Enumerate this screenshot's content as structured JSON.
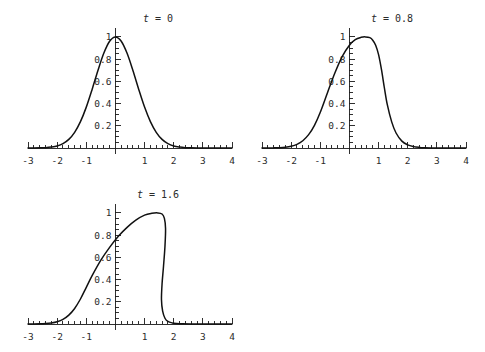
{
  "figure": {
    "background_color": "#ffffff",
    "curve_color": "#111111",
    "axis_color": "#1a1a1a",
    "label_color": "#2b2b2b"
  },
  "chart_data": [
    {
      "type": "line",
      "id": "panel-t0",
      "title": "t = 0",
      "title_var": "t",
      "title_eq": "=",
      "title_value": "0",
      "xlabel": "",
      "ylabel": "",
      "xlim": [
        -3,
        4
      ],
      "ylim": [
        0,
        1.08
      ],
      "grid": false,
      "legend": null,
      "xticks": [
        -3,
        -2,
        -1,
        1,
        2,
        3,
        4
      ],
      "xtick_labels": [
        "-3",
        "-2",
        "-1",
        "1",
        "2",
        "3",
        "4"
      ],
      "yticks": [
        0.2,
        0.4,
        0.6,
        0.8,
        1
      ],
      "ytick_labels": [
        "0.2",
        "0.4",
        "0.6",
        "0.8",
        "1"
      ],
      "x_minor_tick_step": 0.2,
      "y_minor_tick_step": 0.05,
      "x": [
        -3.0,
        -2.8,
        -2.6,
        -2.4,
        -2.2,
        -2.0,
        -1.8,
        -1.6,
        -1.4,
        -1.2,
        -1.0,
        -0.8,
        -0.6,
        -0.4,
        -0.2,
        0.0,
        0.2,
        0.4,
        0.6,
        0.8,
        1.0,
        1.2,
        1.4,
        1.6,
        1.8,
        2.0,
        2.2,
        2.4,
        2.6,
        2.8,
        3.0,
        3.2,
        3.4,
        3.6,
        3.8,
        4.0
      ],
      "y": [
        0.0001,
        0.0004,
        0.0012,
        0.0033,
        0.0085,
        0.0183,
        0.0392,
        0.0773,
        0.1409,
        0.2369,
        0.3679,
        0.5273,
        0.6977,
        0.8521,
        0.9608,
        1.0,
        0.9608,
        0.8521,
        0.6977,
        0.5273,
        0.3679,
        0.2369,
        0.1409,
        0.0773,
        0.0392,
        0.0183,
        0.0085,
        0.0033,
        0.0012,
        0.0004,
        0.0001,
        0.0,
        0.0,
        0.0,
        0.0,
        0.0
      ],
      "description": "Symmetric Gaussian pulse centred at x = 0 with peak height 1."
    },
    {
      "type": "line",
      "id": "panel-t08",
      "title": "t = 0.8",
      "title_var": "t",
      "title_eq": "=",
      "title_value": "0.8",
      "xlabel": "",
      "ylabel": "",
      "xlim": [
        -3,
        4
      ],
      "ylim": [
        0,
        1.08
      ],
      "grid": false,
      "legend": null,
      "xticks": [
        -3,
        -2,
        -1,
        1,
        2,
        3,
        4
      ],
      "xtick_labels": [
        "-3",
        "-2",
        "-1",
        "1",
        "2",
        "3",
        "4"
      ],
      "yticks": [
        0.2,
        0.4,
        0.6,
        0.8,
        1
      ],
      "ytick_labels": [
        "0.2",
        "0.4",
        "0.6",
        "0.8",
        "1"
      ],
      "x_minor_tick_step": 0.2,
      "y_minor_tick_step": 0.05,
      "x": [
        -3.0,
        -2.8,
        -2.6,
        -2.4,
        -2.2,
        -2.0,
        -1.8,
        -1.6,
        -1.4,
        -1.2,
        -1.0,
        -0.75,
        -0.5,
        -0.25,
        0.0,
        0.2,
        0.4,
        0.55,
        0.7,
        0.8,
        0.9,
        1.0,
        1.1,
        1.2,
        1.3,
        1.45,
        1.6,
        1.8,
        2.0,
        2.2,
        2.4,
        2.6,
        2.8,
        3.0,
        3.4,
        4.0
      ],
      "y": [
        0.0001,
        0.0004,
        0.0011,
        0.0029,
        0.0072,
        0.0158,
        0.033,
        0.0655,
        0.12,
        0.204,
        0.322,
        0.5,
        0.675,
        0.823,
        0.925,
        0.975,
        0.996,
        1.0,
        0.993,
        0.97,
        0.925,
        0.84,
        0.705,
        0.54,
        0.39,
        0.235,
        0.135,
        0.062,
        0.028,
        0.0125,
        0.0055,
        0.0022,
        0.0009,
        0.0004,
        0.0001,
        0.0
      ],
      "description": "Gaussian pulse advected and steepened; crest displaced to x ~= 0.85, front face steeper than rear face."
    },
    {
      "type": "line",
      "id": "panel-t16",
      "title": "t = 1.6",
      "title_var": "t",
      "title_eq": "=",
      "title_value": "1.6",
      "xlabel": "",
      "ylabel": "",
      "xlim": [
        -3,
        4
      ],
      "ylim": [
        0,
        1.08
      ],
      "grid": false,
      "legend": null,
      "xticks": [
        -3,
        -2,
        -1,
        1,
        2,
        3,
        4
      ],
      "xtick_labels": [
        "-3",
        "-2",
        "-1",
        "1",
        "2",
        "3",
        "4"
      ],
      "yticks": [
        0.2,
        0.4,
        0.6,
        0.8,
        1
      ],
      "ytick_labels": [
        "0.2",
        "0.4",
        "0.6",
        "0.8",
        "1"
      ],
      "x_minor_tick_step": 0.2,
      "y_minor_tick_step": 0.05,
      "x": [
        -3.0,
        -2.8,
        -2.6,
        -2.4,
        -2.2,
        -2.0,
        -1.8,
        -1.6,
        -1.4,
        -1.2,
        -1.0,
        -0.8,
        -0.5,
        -0.2,
        0.1,
        0.4,
        0.7,
        1.0,
        1.25,
        1.45,
        1.6,
        1.68,
        1.72,
        1.7,
        1.65,
        1.6,
        1.58,
        1.62,
        1.7,
        1.8,
        1.95,
        2.1,
        2.3,
        2.6,
        3.0,
        3.5,
        4.0
      ],
      "y": [
        0.0002,
        0.0006,
        0.0016,
        0.004,
        0.0095,
        0.0205,
        0.042,
        0.08,
        0.14,
        0.225,
        0.33,
        0.435,
        0.575,
        0.69,
        0.79,
        0.87,
        0.935,
        0.98,
        0.996,
        1.0,
        0.99,
        0.95,
        0.86,
        0.7,
        0.52,
        0.36,
        0.22,
        0.115,
        0.052,
        0.023,
        0.0095,
        0.0045,
        0.0018,
        0.0006,
        0.0002,
        0.0001,
        0.0
      ],
      "description": "Wave near breaking: crest at x ~= 1.45 with an almost vertical, slightly overhanging front face near x ~= 1.6-1.7."
    }
  ]
}
